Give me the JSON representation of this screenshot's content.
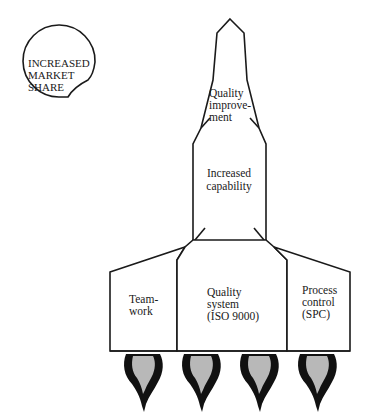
{
  "diagram": {
    "type": "rocket-metaphor",
    "badge": {
      "lines": [
        "INCREASED",
        "MARKET",
        "SHARE"
      ]
    },
    "stages": {
      "nose": {
        "lines": [
          "Quality",
          "improve-",
          "ment"
        ]
      },
      "body": {
        "lines": [
          "Increased",
          "capability"
        ]
      },
      "boosters": [
        {
          "id": "left",
          "lines": [
            "Team-",
            "work"
          ]
        },
        {
          "id": "center",
          "lines": [
            "Quality",
            "system",
            "(ISO 9000)"
          ]
        },
        {
          "id": "right",
          "lines": [
            "Process",
            "control",
            "(SPC)"
          ]
        }
      ]
    },
    "flames_count": 4,
    "colors": {
      "stroke": "#1a1a1a",
      "flame_outer": "#111111",
      "flame_inner": "#b8b8b8",
      "background": "#ffffff"
    }
  }
}
